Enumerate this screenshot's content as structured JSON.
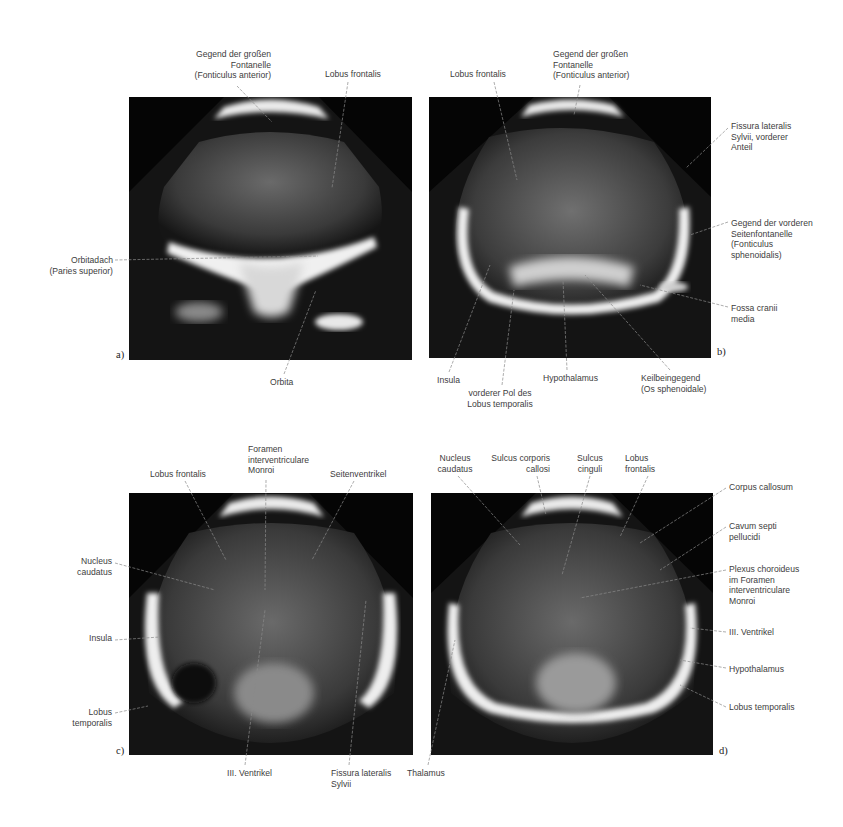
{
  "figure": {
    "panels": [
      {
        "id": "a",
        "panel_label": "a)",
        "labels": {
          "fontanelle": "Gegend der großen\nFontanelle\n(Fonticulus anterior)",
          "lobus_frontalis": "Lobus frontalis",
          "orbitadach": "Orbitadach\n(Paries superior)",
          "orbita": "Orbita"
        }
      },
      {
        "id": "b",
        "panel_label": "b)",
        "labels": {
          "lobus_frontalis": "Lobus frontalis",
          "fontanelle": "Gegend der großen\nFontanelle\n(Fonticulus anterior)",
          "fissura": "Fissura lateralis\nSylvii, vorderer\nAnteil",
          "seitenfontanelle": "Gegend der vorderen\nSeitenfontanelle\n(Fonticulus\nsphenoidalis)",
          "fossa": "Fossa cranii\nmedia",
          "insula": "Insula",
          "pol": "vorderer Pol des\nLobus temporalis",
          "hypothalamus": "Hypothalamus",
          "keilbein": "Keilbeingegend\n(Os sphenoidale)"
        }
      },
      {
        "id": "c",
        "panel_label": "c)",
        "labels": {
          "lobus_frontalis": "Lobus frontalis",
          "foramen": "Foramen\ninterventriculare\nMonroi",
          "seitenventrikel": "Seitenventrikel",
          "nucleus": "Nucleus\ncaudatus",
          "insula": "Insula",
          "lobus_temporalis": "Lobus\ntemporalis",
          "ventrikel3": "III. Ventrikel",
          "fissura": "Fissura lateralis\nSylvii"
        }
      },
      {
        "id": "d",
        "panel_label": "d)",
        "labels": {
          "nucleus": "Nucleus\ncaudatus",
          "sulcus_corporis": "Sulcus corporis\ncallosi",
          "sulcus_cinguli": "Sulcus\ncinguli",
          "lobus_frontalis": "Lobus\nfrontalis",
          "corpus": "Corpus callosum",
          "cavum": "Cavum septi\npellucidi",
          "plexus": "Plexus choroideus\nim Foramen\ninterventriculare\nMonroi",
          "ventrikel3": "III. Ventrikel",
          "hypothalamus": "Hypothalamus",
          "lobus_temporalis": "Lobus temporalis",
          "thalamus": "Thalamus"
        }
      }
    ],
    "colors": {
      "background": "#ffffff",
      "image_bg": "#050505",
      "echo_bright": "#f2f2f2",
      "label_text": "#3d3d3d",
      "leader_line": "#6a6a6a"
    }
  }
}
